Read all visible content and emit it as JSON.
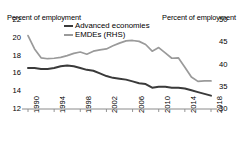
{
  "chart_data": {
    "type": "line",
    "title": "",
    "xlabel": "",
    "ylabel": "Percent of employment",
    "ylabel_right": "Percent of employment",
    "x": [
      1990,
      1991,
      1992,
      1993,
      1994,
      1995,
      1996,
      1997,
      1998,
      1999,
      2000,
      2001,
      2002,
      2003,
      2004,
      2005,
      2006,
      2007,
      2008,
      2009,
      2010,
      2011,
      2012,
      2013,
      2014,
      2015,
      2016,
      2017,
      2018
    ],
    "xtick_labels": [
      "1990",
      "1994",
      "1998",
      "2002",
      "2006",
      "2010",
      "2014",
      "2018"
    ],
    "xticks": [
      1990,
      1994,
      1998,
      2002,
      2006,
      2010,
      2014,
      2018
    ],
    "xlim": [
      1990,
      2018
    ],
    "ylim": [
      12,
      22
    ],
    "yticks": [
      12,
      14,
      16,
      18,
      20,
      22
    ],
    "ytick_labels": [
      "12",
      "14",
      "16",
      "18",
      "20",
      "22"
    ],
    "ylim_right": [
      30,
      50
    ],
    "yticks_right": [
      30,
      35,
      40,
      45,
      50
    ],
    "ytick_labels_right": [
      "30",
      "35",
      "40",
      "45",
      "50"
    ],
    "grid": false,
    "legend_position": "top-center",
    "series": [
      {
        "name": "Advanced economies",
        "axis": "left",
        "color": "#3a3a3a",
        "values": [
          16.6,
          16.6,
          16.5,
          16.5,
          16.6,
          16.8,
          16.9,
          16.8,
          16.6,
          16.4,
          16.3,
          16.0,
          15.7,
          15.5,
          15.4,
          15.3,
          15.1,
          14.9,
          14.8,
          14.4,
          14.5,
          14.5,
          14.4,
          14.4,
          14.3,
          14.1,
          13.9,
          13.7,
          13.5
        ]
      },
      {
        "name": "EMDEs (RHS)",
        "axis": "right",
        "color": "#9a9a9a",
        "values": [
          46.5,
          43.5,
          41.5,
          41.3,
          41.4,
          41.6,
          42.0,
          42.5,
          42.8,
          42.3,
          43.0,
          43.3,
          43.5,
          44.2,
          44.8,
          45.3,
          45.4,
          45.2,
          44.5,
          43.0,
          43.8,
          42.6,
          41.4,
          41.5,
          39.4,
          37.2,
          36.2,
          36.3,
          36.3
        ]
      }
    ]
  },
  "legend": {
    "advanced_label": "Advanced economies",
    "emdes_label": "EMDEs (RHS)"
  },
  "axes": {
    "left_title": "Percent of employment",
    "right_title": "Percent of employment"
  }
}
